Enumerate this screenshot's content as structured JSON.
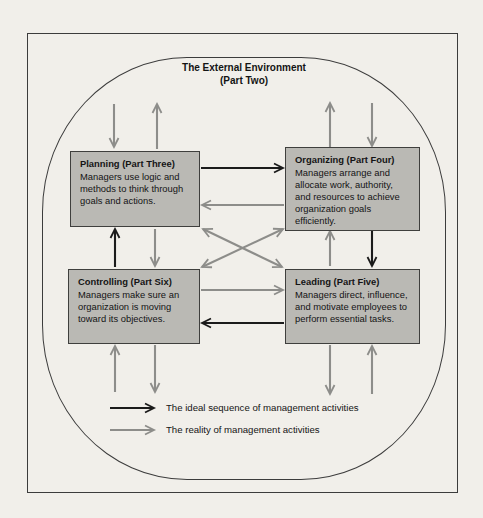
{
  "colors": {
    "background": "#f1efea",
    "box_fill": "#bab9b4",
    "box_border": "#3f3f3d",
    "arrow_black": "#1b1b1b",
    "arrow_gray": "#8d8d8a",
    "outline": "#3c3c3c",
    "text": "#141414"
  },
  "environment": {
    "title_line1": "The External Environment",
    "title_line2": "(Part Two)"
  },
  "boxes": [
    {
      "id": "planning",
      "title": "Planning (Part Three)",
      "description": "Managers use logic and methods to think through goals and actions."
    },
    {
      "id": "organizing",
      "title": "Organizing (Part Four)",
      "description": "Managers arrange and allocate work, authority, and resources to achieve organization goals efficiently."
    },
    {
      "id": "controlling",
      "title": "Controlling (Part Six)",
      "description": "Managers make sure an organization is moving toward its objectives."
    },
    {
      "id": "leading",
      "title": "Leading (Part Five)",
      "description": "Managers direct, influence, and motivate employees to perform essential tasks."
    }
  ],
  "legend": [
    {
      "type": "ideal",
      "label": "The ideal sequence of management activities"
    },
    {
      "type": "reality",
      "label": "The reality of management activities"
    }
  ]
}
